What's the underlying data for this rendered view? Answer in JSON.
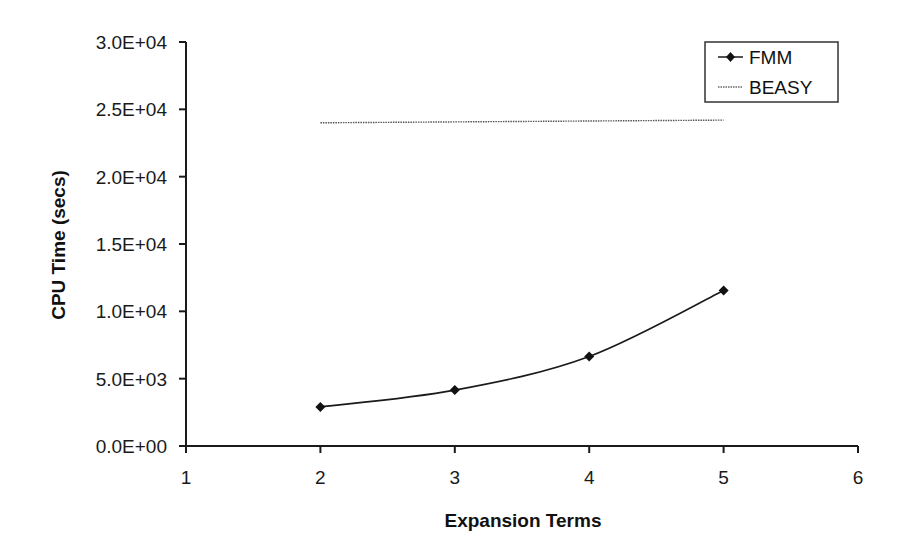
{
  "chart_data": {
    "type": "line",
    "title": "",
    "xlabel": "Expansion Terms",
    "ylabel": "CPU Time (secs)",
    "xlim": [
      1,
      6
    ],
    "ylim": [
      0,
      30000
    ],
    "x_ticks": [
      "1",
      "2",
      "3",
      "4",
      "5",
      "6"
    ],
    "y_ticks": [
      "0.0E+00",
      "5.0E+03",
      "1.0E+04",
      "1.5E+04",
      "2.0E+04",
      "2.5E+04",
      "3.0E+04"
    ],
    "grid": false,
    "legend_position": "top-right",
    "series": [
      {
        "name": "FMM",
        "x": [
          2,
          3,
          4,
          5
        ],
        "values": [
          2900,
          4150,
          6650,
          11550
        ],
        "style": "solid-with-diamond-markers",
        "color": "#1a1a1a"
      },
      {
        "name": "BEASY",
        "x": [
          2,
          5
        ],
        "values": [
          24000,
          24200
        ],
        "style": "dotted",
        "color": "#555555"
      }
    ]
  }
}
